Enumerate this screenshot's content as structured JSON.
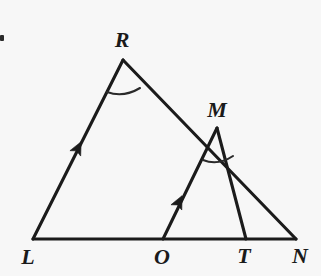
{
  "figure": {
    "background_color": "#f7f7f7",
    "ink_color": "#1b1b1b",
    "width": 321,
    "height": 276
  },
  "points": [
    {
      "id": "L",
      "label": "L",
      "x": 33,
      "y": 239,
      "label_x": 28,
      "label_y": 257
    },
    {
      "id": "O",
      "label": "O",
      "x": 163,
      "y": 239,
      "label_x": 162,
      "label_y": 257
    },
    {
      "id": "T",
      "label": "T",
      "x": 246,
      "y": 239,
      "label_x": 244,
      "label_y": 256
    },
    {
      "id": "N",
      "label": "N",
      "x": 296,
      "y": 239,
      "label_x": 300,
      "label_y": 256
    },
    {
      "id": "R",
      "label": "R",
      "x": 123,
      "y": 60,
      "label_x": 122,
      "label_y": 40
    },
    {
      "id": "M",
      "label": "M",
      "x": 217,
      "y": 128,
      "label_x": 217,
      "label_y": 110
    }
  ],
  "segments": [
    {
      "id": "LN",
      "from": "L",
      "to": "N",
      "role": "base-line"
    },
    {
      "id": "LR",
      "from": "L",
      "to": "R",
      "role": "parallel-marked-side"
    },
    {
      "id": "RN",
      "from": "R",
      "to": "N",
      "role": "side"
    },
    {
      "id": "OM",
      "from": "O",
      "to": "M",
      "role": "parallel-marked-side"
    },
    {
      "id": "MT",
      "from": "M",
      "to": "T",
      "role": "side"
    }
  ],
  "arrow_marks": [
    {
      "id": "arrow-LR",
      "on_segment": "LR",
      "x": 78,
      "y": 148,
      "angle_deg": -54,
      "meaning": "single arrow (parallel mark)"
    },
    {
      "id": "arrow-OM",
      "on_segment": "OM",
      "x": 179,
      "y": 202,
      "angle_deg": -55,
      "meaning": "single arrow (parallel mark)"
    }
  ],
  "angle_arcs": [
    {
      "id": "arc-R",
      "at_vertex": "R",
      "start_x": 107,
      "start_y": 92,
      "end_x": 140,
      "end_y": 88,
      "sweep_y": 98
    },
    {
      "id": "arc-M",
      "at_vertex": "M",
      "start_x": 203,
      "start_y": 160,
      "end_x": 233,
      "end_y": 156,
      "sweep_y": 166
    }
  ],
  "triangles": [
    {
      "id": "LRN",
      "vertices": "L R N"
    },
    {
      "id": "OMT",
      "vertices": "O M T"
    }
  ],
  "artifacts": [
    {
      "id": "corner-mark",
      "x": 0,
      "y": 35,
      "width": 4,
      "height": 6
    }
  ]
}
